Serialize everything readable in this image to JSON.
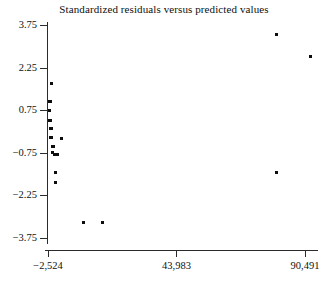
{
  "chart_data": {
    "type": "scatter",
    "title": "Standardized residuals versus predicted values",
    "xlabel": "",
    "ylabel": "",
    "grid": false,
    "legend": false,
    "xlim": [
      -2524,
      90491
    ],
    "ylim": [
      -4.35,
      3.95
    ],
    "xticks": [
      -2524,
      43983,
      90491
    ],
    "xtick_labels": [
      "-2,524",
      "43,983",
      "90,491"
    ],
    "yticks": [
      3.75,
      2.25,
      0.75,
      -0.75,
      -2.25,
      -3.75
    ],
    "ytick_labels": [
      "3.75",
      "2.25",
      "0.75",
      "-0.75",
      "-2.25",
      "-3.75"
    ],
    "marker": "filled-square",
    "marker_color": "#0d0d0d",
    "axis_color": "#2b2b2b",
    "series": [
      {
        "name": "standardized residuals",
        "points": [
          [
            -1428,
            1.7
          ],
          [
            -2147,
            1.07
          ],
          [
            -1792,
            1.07
          ],
          [
            -2147,
            0.75
          ],
          [
            -2117,
            0.4
          ],
          [
            -1782,
            0.4
          ],
          [
            -1450,
            0.12
          ],
          [
            -1100,
            0.12
          ],
          [
            -1460,
            -0.21
          ],
          [
            -1110,
            -0.21
          ],
          [
            -906,
            -0.53
          ],
          [
            -540,
            -0.53
          ],
          [
            -906,
            -0.75
          ],
          [
            -200,
            -0.8
          ],
          [
            900,
            -0.8
          ],
          [
            2400,
            -0.25
          ],
          [
            180,
            -1.45
          ],
          [
            180,
            -1.78
          ],
          [
            10300,
            -3.2
          ],
          [
            17200,
            -3.2
          ],
          [
            80100,
            3.4
          ],
          [
            92600,
            2.63
          ],
          [
            80100,
            -1.45
          ]
        ]
      }
    ],
    "n_points": 23
  },
  "figure": {
    "caption": ""
  }
}
